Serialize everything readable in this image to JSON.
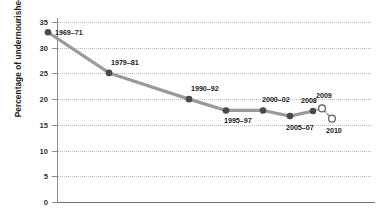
{
  "chart_data": {
    "type": "line",
    "title": "",
    "xlabel": "",
    "ylabel": "Percentage of undernourished",
    "ylim": [
      0,
      35
    ],
    "ytick_values": [
      0,
      5,
      10,
      15,
      20,
      25,
      30,
      35
    ],
    "ytick_labels": [
      "0",
      "5",
      "10",
      "15",
      "20",
      "25",
      "30",
      "35"
    ],
    "grid": "horizontal-dotted",
    "legend": "none",
    "categories": [
      "1969–71",
      "1979–81",
      "1990–92",
      "1995–97",
      "2000–02",
      "2005–07",
      "2008",
      "2009",
      "2010"
    ],
    "values": [
      33.0,
      25.1,
      20.0,
      17.8,
      17.8,
      16.7,
      17.7,
      18.2,
      16.2
    ],
    "series": [
      {
        "name": "Observed undernourishment",
        "marker": "filled-circle",
        "line": "solid",
        "points": [
          {
            "label": "1969–71",
            "value": 33.0
          },
          {
            "label": "1979–81",
            "value": 25.1
          },
          {
            "label": "1990–92",
            "value": 20.0
          },
          {
            "label": "1995–97",
            "value": 17.8
          },
          {
            "label": "2000–02",
            "value": 17.8
          },
          {
            "label": "2005–07",
            "value": 16.7
          },
          {
            "label": "2008",
            "value": 17.7
          }
        ]
      },
      {
        "name": "Estimated undernourishment",
        "marker": "open-circle",
        "line": "dotted",
        "points": [
          {
            "label": "2009",
            "value": 18.2
          },
          {
            "label": "2010",
            "value": 16.2
          }
        ]
      }
    ],
    "annotations": [
      {
        "text": "1969–71",
        "for": "1969–71",
        "position": "right"
      },
      {
        "text": "1979–81",
        "for": "1979–81",
        "position": "above"
      },
      {
        "text": "1990–92",
        "for": "1990–92",
        "position": "above"
      },
      {
        "text": "1995–97",
        "for": "1995–97",
        "position": "below"
      },
      {
        "text": "2000–02",
        "for": "2000–02",
        "position": "above"
      },
      {
        "text": "2005–07",
        "for": "2005–07",
        "position": "below"
      },
      {
        "text": "2008",
        "for": "2008",
        "position": "above"
      },
      {
        "text": "2009",
        "for": "2009",
        "position": "above"
      },
      {
        "text": "2010",
        "for": "2010",
        "position": "below"
      }
    ],
    "colors": {
      "line": "#9a9a9a",
      "marker_fill": "#4a4a4a",
      "marker_open_stroke": "#6e6e6e",
      "grid": "#b9b9b9",
      "axis": "#6f6f6f",
      "text": "#1b1b1b"
    }
  }
}
